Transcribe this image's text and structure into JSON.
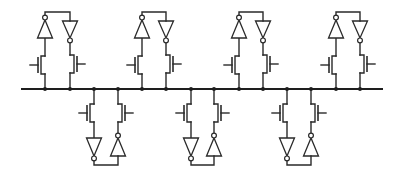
{
  "diagram": {
    "bus": {
      "x1": 21,
      "x2": 383,
      "y": 89
    },
    "colors": {
      "line": "#2a2a2a",
      "background": "#ffffff"
    },
    "cells": [
      {
        "side": "top",
        "left_x": 45,
        "right_x": 70
      },
      {
        "side": "bottom",
        "left_x": 94,
        "right_x": 118
      },
      {
        "side": "top",
        "left_x": 142,
        "right_x": 166
      },
      {
        "side": "bottom",
        "left_x": 191,
        "right_x": 214
      },
      {
        "side": "top",
        "left_x": 239,
        "right_x": 263
      },
      {
        "side": "bottom",
        "left_x": 287,
        "right_x": 311
      },
      {
        "side": "top",
        "left_x": 336,
        "right_x": 360
      }
    ],
    "components_per_cell": [
      "nmos-transistor-left",
      "nmos-transistor-right",
      "inverter-left",
      "inverter-right",
      "feedback-wire"
    ]
  }
}
